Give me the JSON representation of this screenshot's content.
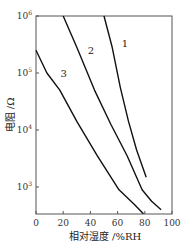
{
  "chart_data": {
    "type": "line",
    "title": "",
    "xlabel": "相对湿度 /%RH",
    "ylabel": "电阻 /Ω",
    "xlim": [
      0,
      100
    ],
    "ylim": [
      340,
      1000000
    ],
    "yscale": "log",
    "xticks": [
      "0",
      "20",
      "40",
      "60",
      "80",
      "100"
    ],
    "yticks": [
      {
        "base": "10",
        "exp": "3",
        "value": 1000
      },
      {
        "base": "10",
        "exp": "4",
        "value": 10000
      },
      {
        "base": "10",
        "exp": "5",
        "value": 100000
      },
      {
        "base": "10",
        "exp": "6",
        "value": 1000000
      }
    ],
    "grid": false,
    "legend": "none (curves labeled inline)",
    "series": [
      {
        "name": "1",
        "x": [
          50,
          56,
          62,
          68,
          74,
          81
        ],
        "log10_y": [
          6.0,
          5.45,
          4.75,
          4.15,
          3.65,
          3.17
        ]
      },
      {
        "name": "2",
        "x": [
          20,
          30,
          43,
          55,
          67,
          78,
          85,
          92
        ],
        "log10_y": [
          6.0,
          5.45,
          4.7,
          4.1,
          3.55,
          2.95,
          2.75,
          2.6
        ]
      },
      {
        "name": "3",
        "x": [
          0,
          8,
          17.5,
          30,
          45,
          61,
          72,
          79
        ],
        "log10_y": [
          5.4,
          5.0,
          4.7,
          4.15,
          3.55,
          2.95,
          2.7,
          2.53
        ]
      }
    ],
    "curve_labels": [
      {
        "text": "1",
        "x": 63,
        "log10_y": 5.45
      },
      {
        "text": "2",
        "x": 38,
        "log10_y": 5.33
      },
      {
        "text": "3",
        "x": 18,
        "log10_y": 4.93
      }
    ]
  }
}
